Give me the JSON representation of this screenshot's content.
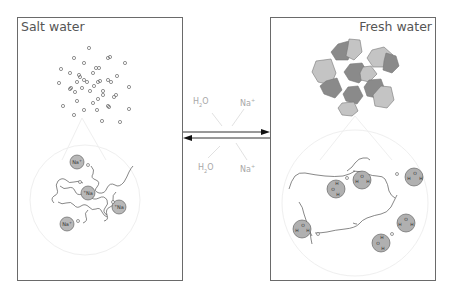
{
  "left_panel": {
    "title": "Salt water",
    "ion_label": "Na",
    "ion_charge": "+",
    "ion_count": 4
  },
  "right_panel": {
    "title": "Fresh water",
    "water_molecule_count": 6,
    "water_atoms": {
      "oxygen": "O",
      "hydrogen": "H"
    }
  },
  "center": {
    "top_left_label": {
      "base": "H",
      "sub": "2",
      "tail": "O"
    },
    "top_right_label": {
      "base": "Na",
      "sup": "+"
    },
    "bottom_left_label": {
      "base": "H",
      "sub": "2",
      "tail": "O"
    },
    "bottom_right_label": {
      "base": "Na",
      "sup": "+"
    },
    "arrow_forward": "right",
    "arrow_reverse": "left"
  },
  "colors": {
    "border": "#6a6a6a",
    "ion_fill": "#b8b8b8",
    "water_fill": "#b0b0b0",
    "chain": "#555555",
    "zoom_circle": "#ececec",
    "polygon_dark": "#8a8a8a",
    "polygon_light": "#c4c4c4",
    "label": "#a8a8a8"
  }
}
